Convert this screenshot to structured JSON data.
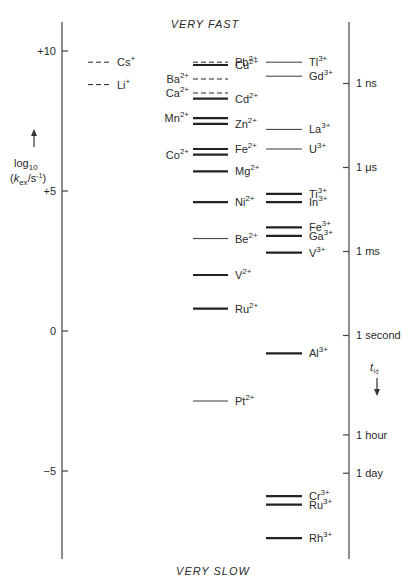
{
  "chart_data": {
    "type": "scatter",
    "title": "",
    "top_label": "VERY FAST",
    "bottom_label": "VERY SLOW",
    "ylabel_line1": "log10",
    "ylabel_line2": "(kex/s-1)",
    "ylim": [
      -8,
      11.2
    ],
    "grid": false,
    "left_axis": {
      "ticks": [
        {
          "value": 10,
          "label": "+10"
        },
        {
          "value": 5,
          "label": "+5"
        },
        {
          "value": 0,
          "label": "0"
        },
        {
          "value": -5,
          "label": "−5"
        }
      ]
    },
    "right_axis": {
      "label": "t½",
      "ticks": [
        {
          "value": 8.84,
          "label": "1 ns"
        },
        {
          "value": 5.84,
          "label": "1 μs"
        },
        {
          "value": 2.84,
          "label": "1 ms"
        },
        {
          "value": -0.16,
          "label": "1 second"
        },
        {
          "value": -3.71,
          "label": "1 hour"
        },
        {
          "value": -5.08,
          "label": "1 day"
        }
      ]
    },
    "series": [
      {
        "name": "M+ ions",
        "column": 0,
        "points": [
          {
            "ion": "Cs",
            "charge": "+",
            "log_kex": 9.6,
            "style": "dashed",
            "label_side": "right"
          },
          {
            "ion": "Li",
            "charge": "+",
            "log_kex": 8.8,
            "style": "dashed",
            "label_side": "right"
          }
        ]
      },
      {
        "name": "M2+ ions",
        "column": 1,
        "points": [
          {
            "ion": "Pb",
            "charge": "2+",
            "log_kex": 9.6,
            "style": "dashed",
            "label_side": "right"
          },
          {
            "ion": "Cu",
            "charge": "2+",
            "log_kex": 9.5,
            "style": "thick",
            "label_side": "right"
          },
          {
            "ion": "Ba",
            "charge": "2+",
            "log_kex": 9.0,
            "style": "dashed",
            "label_side": "left"
          },
          {
            "ion": "Ca",
            "charge": "2+",
            "log_kex": 8.5,
            "style": "dashed",
            "label_side": "left"
          },
          {
            "ion": "Cd",
            "charge": "2+",
            "log_kex": 8.3,
            "style": "thick",
            "label_side": "right"
          },
          {
            "ion": "Mn",
            "charge": "2+",
            "log_kex": 7.6,
            "style": "thick",
            "label_side": "left"
          },
          {
            "ion": "Zn",
            "charge": "2+",
            "log_kex": 7.4,
            "style": "thick",
            "label_side": "right"
          },
          {
            "ion": "Fe",
            "charge": "2+",
            "log_kex": 6.5,
            "style": "thick",
            "label_side": "right"
          },
          {
            "ion": "Co",
            "charge": "2+",
            "log_kex": 6.3,
            "style": "thick",
            "label_side": "left"
          },
          {
            "ion": "Mg",
            "charge": "2+",
            "log_kex": 5.7,
            "style": "thick",
            "label_side": "right"
          },
          {
            "ion": "Ni",
            "charge": "2+",
            "log_kex": 4.6,
            "style": "thick",
            "label_side": "right"
          },
          {
            "ion": "Be",
            "charge": "2+",
            "log_kex": 3.3,
            "style": "thin",
            "label_side": "right"
          },
          {
            "ion": "V",
            "charge": "2+",
            "log_kex": 2.0,
            "style": "thick",
            "label_side": "right"
          },
          {
            "ion": "Ru",
            "charge": "2+",
            "log_kex": 0.8,
            "style": "thick",
            "label_side": "right"
          },
          {
            "ion": "Pt",
            "charge": "2+",
            "log_kex": -2.5,
            "style": "thin",
            "label_side": "right"
          }
        ]
      },
      {
        "name": "M3+ ions",
        "column": 2,
        "points": [
          {
            "ion": "Tl",
            "charge": "3+",
            "log_kex": 9.6,
            "style": "thin",
            "label_side": "right"
          },
          {
            "ion": "Gd",
            "charge": "3+",
            "log_kex": 9.1,
            "style": "thin",
            "label_side": "right"
          },
          {
            "ion": "La",
            "charge": "3+",
            "log_kex": 7.2,
            "style": "thin",
            "label_side": "right"
          },
          {
            "ion": "U",
            "charge": "3+",
            "log_kex": 6.5,
            "style": "thin",
            "label_side": "right"
          },
          {
            "ion": "Ti",
            "charge": "3+",
            "log_kex": 4.9,
            "style": "thick",
            "label_side": "right"
          },
          {
            "ion": "In",
            "charge": "3+",
            "log_kex": 4.6,
            "style": "thick",
            "label_side": "right"
          },
          {
            "ion": "Fe",
            "charge": "3+",
            "log_kex": 3.7,
            "style": "thick",
            "label_side": "right"
          },
          {
            "ion": "Ga",
            "charge": "3+",
            "log_kex": 3.4,
            "style": "thick",
            "label_side": "right"
          },
          {
            "ion": "V",
            "charge": "3+",
            "log_kex": 2.8,
            "style": "thick",
            "label_side": "right"
          },
          {
            "ion": "Al",
            "charge": "3+",
            "log_kex": -0.8,
            "style": "thick",
            "label_side": "right"
          },
          {
            "ion": "Cr",
            "charge": "3+",
            "log_kex": -5.9,
            "style": "thick",
            "label_side": "right"
          },
          {
            "ion": "Ru",
            "charge": "3+",
            "log_kex": -6.2,
            "style": "thick",
            "label_side": "right"
          },
          {
            "ion": "Rh",
            "charge": "3+",
            "log_kex": -7.4,
            "style": "thick",
            "label_side": "right"
          }
        ]
      }
    ]
  }
}
